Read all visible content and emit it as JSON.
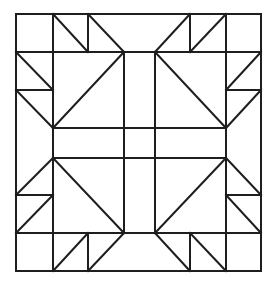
{
  "diagram": {
    "type": "quilt-block-pattern",
    "colors": {
      "background": "#ffffff",
      "line": "#1e1e1e"
    },
    "line_width": 2,
    "outer_border": {
      "x1": 16,
      "y1": 14,
      "x2": 261,
      "y2": 271
    },
    "segments": [
      {
        "id": "h-52",
        "x1": 16,
        "y1": 52,
        "x2": 261,
        "y2": 52
      },
      {
        "id": "h-233",
        "x1": 16,
        "y1": 233,
        "x2": 261,
        "y2": 233
      },
      {
        "id": "h-128",
        "x1": 53,
        "y1": 128,
        "x2": 226,
        "y2": 128
      },
      {
        "id": "h-158",
        "x1": 53,
        "y1": 158,
        "x2": 226,
        "y2": 158
      },
      {
        "id": "v-53-top",
        "x1": 53,
        "y1": 14,
        "x2": 53,
        "y2": 52
      },
      {
        "id": "v-53-mid",
        "x1": 53,
        "y1": 52,
        "x2": 53,
        "y2": 233
      },
      {
        "id": "v-53-bot",
        "x1": 53,
        "y1": 233,
        "x2": 53,
        "y2": 271
      },
      {
        "id": "v-226-top",
        "x1": 226,
        "y1": 14,
        "x2": 226,
        "y2": 52
      },
      {
        "id": "v-226-mid",
        "x1": 226,
        "y1": 52,
        "x2": 226,
        "y2": 233
      },
      {
        "id": "v-226-bot",
        "x1": 226,
        "y1": 233,
        "x2": 226,
        "y2": 271
      },
      {
        "id": "v-124",
        "x1": 124,
        "y1": 52,
        "x2": 124,
        "y2": 233
      },
      {
        "id": "v-155",
        "x1": 155,
        "y1": 52,
        "x2": 155,
        "y2": 233
      },
      {
        "id": "v-88-top",
        "x1": 88,
        "y1": 14,
        "x2": 88,
        "y2": 52
      },
      {
        "id": "v-190-top",
        "x1": 190,
        "y1": 14,
        "x2": 190,
        "y2": 52
      },
      {
        "id": "v-88-bot",
        "x1": 88,
        "y1": 233,
        "x2": 88,
        "y2": 271
      },
      {
        "id": "v-190-bot",
        "x1": 190,
        "y1": 233,
        "x2": 190,
        "y2": 271
      },
      {
        "id": "h-90-left",
        "x1": 16,
        "y1": 90,
        "x2": 53,
        "y2": 90
      },
      {
        "id": "h-90-right",
        "x1": 226,
        "y1": 90,
        "x2": 261,
        "y2": 90
      },
      {
        "id": "h-195-left",
        "x1": 16,
        "y1": 195,
        "x2": 53,
        "y2": 195
      },
      {
        "id": "h-195-right",
        "x1": 226,
        "y1": 195,
        "x2": 261,
        "y2": 195
      },
      {
        "id": "d-top-left-1",
        "x1": 53,
        "y1": 14,
        "x2": 88,
        "y2": 52
      },
      {
        "id": "d-top-left-2",
        "x1": 88,
        "y1": 14,
        "x2": 124,
        "y2": 52
      },
      {
        "id": "d-top-right-1",
        "x1": 190,
        "y1": 14,
        "x2": 155,
        "y2": 52
      },
      {
        "id": "d-top-right-2",
        "x1": 226,
        "y1": 14,
        "x2": 190,
        "y2": 52
      },
      {
        "id": "d-left-top-1",
        "x1": 16,
        "y1": 52,
        "x2": 53,
        "y2": 90
      },
      {
        "id": "d-left-top-2",
        "x1": 16,
        "y1": 90,
        "x2": 53,
        "y2": 128
      },
      {
        "id": "d-left-bot-1",
        "x1": 53,
        "y1": 158,
        "x2": 16,
        "y2": 195
      },
      {
        "id": "d-left-bot-2",
        "x1": 53,
        "y1": 195,
        "x2": 16,
        "y2": 233
      },
      {
        "id": "d-right-top-1",
        "x1": 261,
        "y1": 52,
        "x2": 226,
        "y2": 90
      },
      {
        "id": "d-right-top-2",
        "x1": 261,
        "y1": 90,
        "x2": 226,
        "y2": 128
      },
      {
        "id": "d-right-bot-1",
        "x1": 226,
        "y1": 158,
        "x2": 261,
        "y2": 195
      },
      {
        "id": "d-right-bot-2",
        "x1": 226,
        "y1": 195,
        "x2": 261,
        "y2": 233
      },
      {
        "id": "d-bot-left-1",
        "x1": 88,
        "y1": 233,
        "x2": 53,
        "y2": 271
      },
      {
        "id": "d-bot-left-2",
        "x1": 124,
        "y1": 233,
        "x2": 88,
        "y2": 271
      },
      {
        "id": "d-bot-right-1",
        "x1": 155,
        "y1": 233,
        "x2": 190,
        "y2": 271
      },
      {
        "id": "d-bot-right-2",
        "x1": 190,
        "y1": 233,
        "x2": 226,
        "y2": 271
      },
      {
        "id": "d-big-top-left",
        "x1": 124,
        "y1": 52,
        "x2": 53,
        "y2": 128
      },
      {
        "id": "d-big-top-right",
        "x1": 155,
        "y1": 52,
        "x2": 226,
        "y2": 128
      },
      {
        "id": "d-big-bot-left",
        "x1": 53,
        "y1": 158,
        "x2": 124,
        "y2": 233
      },
      {
        "id": "d-big-bot-right",
        "x1": 226,
        "y1": 158,
        "x2": 155,
        "y2": 233
      }
    ]
  }
}
